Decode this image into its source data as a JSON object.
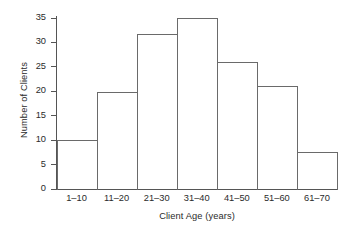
{
  "chart_data": {
    "type": "bar",
    "title": "",
    "xlabel": "Client Age (years)",
    "ylabel": "Number of Clients",
    "categories": [
      "1–10",
      "11–20",
      "21–30",
      "31–40",
      "41–50",
      "51–60",
      "61–70"
    ],
    "values": [
      10,
      19.8,
      31.7,
      35,
      26,
      21,
      7.5
    ],
    "ylim": [
      0,
      36.5
    ],
    "yticks": [
      0,
      5,
      10,
      15,
      20,
      25,
      30,
      35
    ],
    "ytick_labels": [
      "0",
      "5",
      "10",
      "15",
      "20",
      "25",
      "30",
      "35"
    ],
    "grid": false,
    "legend": false,
    "bar_style": {
      "fill": "none",
      "edge_color": "#6a6a6a",
      "gap": 0
    },
    "axis_color": "#555555",
    "text_color": "#2b2b2b",
    "background": "#ffffff"
  }
}
